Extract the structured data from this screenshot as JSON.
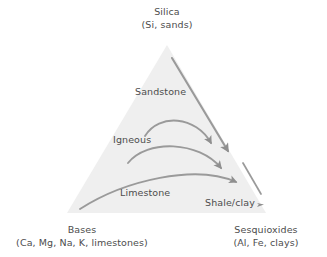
{
  "figure": {
    "type": "ternary-conceptual-diagram",
    "background_color": "#ffffff",
    "triangle": {
      "fill_color": "#efefef",
      "apex": [
        167,
        45
      ],
      "bottom_left": [
        67,
        213
      ],
      "bottom_right": [
        266,
        213
      ]
    },
    "arrow_color": "#909090"
  },
  "corners": {
    "top": {
      "name": "Silica",
      "detail": "(Si, sands)"
    },
    "bottom_left": {
      "name": "Bases",
      "detail": "(Ca, Mg, Na, K, limestones)"
    },
    "bottom_right": {
      "name": "Sesquioxides",
      "detail": "(Al, Fe, clays)"
    }
  },
  "interior_labels": {
    "sandstone": "Sandstone",
    "igneous": "Igneous",
    "limestone": "Limestone",
    "shale_clay": "Shale/clay"
  },
  "pathways": [
    {
      "id": "sandstone-path",
      "label": "Sandstone",
      "shape": "straight",
      "from": [
        172,
        58
      ],
      "to": [
        230,
        155
      ],
      "arrowhead": "end"
    },
    {
      "id": "igneous-path-upper",
      "label": "Igneous",
      "shape": "arc",
      "from": [
        145,
        135
      ],
      "to": [
        213,
        147
      ],
      "arrowhead": "end"
    },
    {
      "id": "igneous-path-lower",
      "label": "Igneous",
      "shape": "arc",
      "from": [
        128,
        162
      ],
      "to": [
        223,
        172
      ],
      "arrowhead": "end"
    },
    {
      "id": "limestone-path",
      "label": "Limestone",
      "shape": "arc",
      "from": [
        80,
        209
      ],
      "to": [
        238,
        186
      ],
      "arrowhead": "end"
    },
    {
      "id": "shale-clay-path",
      "label": "Shale/clay",
      "shape": "straight",
      "from": [
        243,
        163
      ],
      "to": [
        264,
        198
      ],
      "arrowhead": "end"
    }
  ]
}
